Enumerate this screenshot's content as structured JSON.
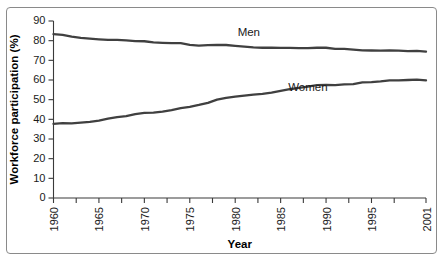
{
  "figure": {
    "border_color": "#8a8a8a",
    "background": "#ffffff"
  },
  "chart_data": {
    "type": "line",
    "title": "",
    "xlabel": "Year",
    "ylabel": "Workforce participation (%)",
    "xlim": [
      1960,
      2001
    ],
    "ylim": [
      0,
      90
    ],
    "grid": false,
    "legend_position": "inline-annotation",
    "y_ticks": [
      0,
      10,
      20,
      30,
      40,
      50,
      60,
      70,
      80,
      90
    ],
    "y_tick_labels": [
      "0",
      "10",
      "20",
      "30",
      "40",
      "50",
      "60",
      "70",
      "80",
      "90"
    ],
    "x_ticks": [
      1960,
      1962.5,
      1965,
      1967.5,
      1970,
      1972.5,
      1975,
      1977.5,
      1980,
      1982.5,
      1985,
      1987.5,
      1990,
      1992.5,
      1995,
      1997.5,
      2001
    ],
    "x_tick_labels": [
      "1960",
      "1965",
      "1970",
      "1975",
      "1980",
      "1985",
      "1990",
      "1995",
      "2001"
    ],
    "x_labeled_ticks": [
      1960,
      1965,
      1970,
      1975,
      1980,
      1985,
      1990,
      1995,
      2001
    ],
    "x": [
      1960,
      1961,
      1962,
      1963,
      1964,
      1965,
      1966,
      1967,
      1968,
      1969,
      1970,
      1971,
      1972,
      1973,
      1974,
      1975,
      1976,
      1977,
      1978,
      1979,
      1980,
      1981,
      1982,
      1983,
      1984,
      1985,
      1986,
      1987,
      1988,
      1989,
      1990,
      1991,
      1992,
      1993,
      1994,
      1995,
      1996,
      1997,
      1998,
      1999,
      2000,
      2001
    ],
    "series": [
      {
        "name": "Men",
        "color": "#404040",
        "label_x": 1981.5,
        "label_y": 82.5,
        "values": [
          83.3,
          82.9,
          82.0,
          81.4,
          81.0,
          80.7,
          80.4,
          80.4,
          80.1,
          79.8,
          79.7,
          79.1,
          78.9,
          78.8,
          78.7,
          77.9,
          77.5,
          77.7,
          77.9,
          77.8,
          77.4,
          77.0,
          76.6,
          76.4,
          76.4,
          76.3,
          76.3,
          76.2,
          76.2,
          76.4,
          76.4,
          75.8,
          75.8,
          75.4,
          75.1,
          75.0,
          74.9,
          75.0,
          74.9,
          74.7,
          74.8,
          74.4
        ]
      },
      {
        "name": "Women",
        "color": "#404040",
        "label_x": 1988.0,
        "label_y": 54.5,
        "values": [
          37.7,
          38.1,
          37.9,
          38.3,
          38.7,
          39.3,
          40.3,
          41.1,
          41.6,
          42.7,
          43.3,
          43.4,
          43.9,
          44.7,
          45.7,
          46.3,
          47.3,
          48.4,
          50.0,
          50.9,
          51.5,
          52.1,
          52.6,
          52.9,
          53.6,
          54.5,
          55.3,
          56.0,
          56.6,
          57.4,
          57.5,
          57.4,
          57.8,
          57.9,
          58.8,
          58.9,
          59.3,
          59.8,
          59.8,
          60.0,
          60.2,
          59.8
        ]
      }
    ]
  }
}
